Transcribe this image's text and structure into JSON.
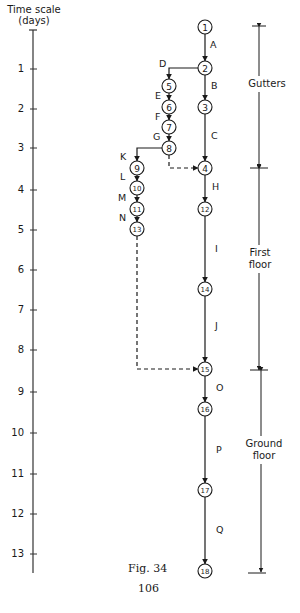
{
  "diagram": {
    "type": "network_arrow_diagram_on_time_scale",
    "time_axis": {
      "title_line1": "Time scale",
      "title_line2": "(days)",
      "ticks": [
        "1",
        "2",
        "3",
        "4",
        "5",
        "6",
        "7",
        "8",
        "9",
        "10",
        "11",
        "12",
        "13"
      ]
    },
    "nodes": {
      "n1": "1",
      "n2": "2",
      "n3": "3",
      "n4": "4",
      "n5": "5",
      "n6": "6",
      "n7": "7",
      "n8": "8",
      "n9": "9",
      "n10": "10",
      "n11": "11",
      "n12": "12",
      "n13": "13",
      "n14": "14",
      "n15": "15",
      "n16": "16",
      "n17": "17",
      "n18": "18"
    },
    "activities": {
      "A": "A",
      "B": "B",
      "C": "C",
      "D": "D",
      "E": "E",
      "F": "F",
      "G": "G",
      "H": "H",
      "I": "I",
      "J": "J",
      "K": "K",
      "L": "L",
      "M": "M",
      "N": "N",
      "O": "O",
      "P": "P",
      "Q": "Q"
    },
    "edges": [
      {
        "from": "1",
        "to": "2",
        "activity": "A"
      },
      {
        "from": "2",
        "to": "3",
        "activity": "B"
      },
      {
        "from": "3",
        "to": "4",
        "activity": "C"
      },
      {
        "from": "2",
        "to": "5",
        "activity": "D"
      },
      {
        "from": "5",
        "to": "6",
        "activity": "E"
      },
      {
        "from": "6",
        "to": "7",
        "activity": "F"
      },
      {
        "from": "7",
        "to": "8",
        "activity": "G"
      },
      {
        "from": "8",
        "to": "4",
        "activity": "dummy"
      },
      {
        "from": "8",
        "to": "9",
        "activity": "K"
      },
      {
        "from": "9",
        "to": "10",
        "activity": "L"
      },
      {
        "from": "10",
        "to": "11",
        "activity": "M"
      },
      {
        "from": "11",
        "to": "13",
        "activity": "N"
      },
      {
        "from": "4",
        "to": "12",
        "activity": "H"
      },
      {
        "from": "12",
        "to": "14",
        "activity": "I"
      },
      {
        "from": "14",
        "to": "15",
        "activity": "J"
      },
      {
        "from": "13",
        "to": "15",
        "activity": "dummy"
      },
      {
        "from": "15",
        "to": "16",
        "activity": "O"
      },
      {
        "from": "16",
        "to": "17",
        "activity": "P"
      },
      {
        "from": "17",
        "to": "18",
        "activity": "Q"
      }
    ],
    "phases": {
      "gutters": "Gutters",
      "first_line1": "First",
      "first_line2": "floor",
      "ground_line1": "Ground",
      "ground_line2": "floor"
    },
    "caption": "Fig. 34",
    "page_number": "106"
  }
}
